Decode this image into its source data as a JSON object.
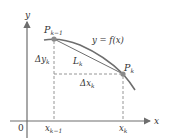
{
  "diagram": {
    "colors": {
      "axis": "#6e6e6e",
      "curve": "#6e6e6e",
      "chord": "#6e6e6e",
      "dashed": "#8a8a8a",
      "point": "#8a8a8a",
      "text": "#333333"
    },
    "axes": {
      "x_label": "x",
      "y_label": "y",
      "origin_label": "0"
    },
    "curve_label": "y = f(x)",
    "points": [
      {
        "id": "P_k_minus_1",
        "base": "P",
        "sub": "k−1"
      },
      {
        "id": "P_k",
        "base": "P",
        "sub": "k"
      }
    ],
    "chord_label": {
      "base": "L",
      "sub": "k"
    },
    "delta_y_label": {
      "base": "Δy",
      "sub": "k"
    },
    "delta_x_label": {
      "base": "Δx",
      "sub": "k"
    },
    "x_ticks": [
      {
        "base": "x",
        "sub": "k−1"
      },
      {
        "base": "x",
        "sub": "k"
      }
    ]
  }
}
